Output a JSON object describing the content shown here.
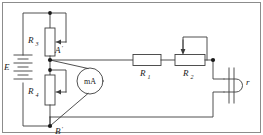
{
  "figure": {
    "type": "electrical-circuit-schematic",
    "border": true,
    "line_color": "#3d3d3d",
    "label_color": "#1a1a1a",
    "background": "#ffffff"
  },
  "components": {
    "battery": {
      "name": "battery",
      "label": "E",
      "cells": 3
    },
    "rheostat_r3": {
      "name": "rheostat-r3",
      "label_base": "R",
      "label_sub": "3"
    },
    "rheostat_r4": {
      "name": "rheostat-r4",
      "label_base": "R",
      "label_sub": "4"
    },
    "resistor_r1": {
      "name": "resistor-r1",
      "label_base": "R",
      "label_sub": "1"
    },
    "potentiometer_r2": {
      "name": "potentiometer-r2",
      "label_base": "R",
      "label_sub": "2"
    },
    "milliammeter": {
      "name": "milliammeter",
      "label": "mA"
    },
    "load": {
      "name": "load-r",
      "label": "r"
    }
  },
  "terminals": {
    "upper": {
      "name": "terminal-a-prime",
      "label": "A",
      "prime": "′"
    },
    "lower": {
      "name": "terminal-b-prime",
      "label": "B",
      "prime": "′"
    }
  }
}
